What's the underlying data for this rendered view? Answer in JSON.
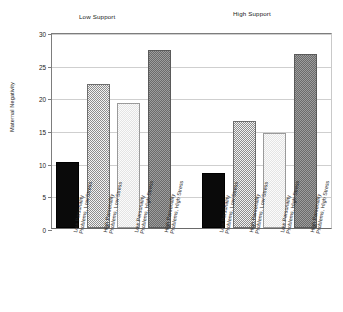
{
  "chart_data": {
    "type": "bar",
    "title": "",
    "xlabel": "",
    "ylabel": "Maternal Negativity",
    "ylim": [
      0,
      30
    ],
    "yticks": [
      0,
      5,
      10,
      15,
      20,
      25,
      30
    ],
    "grid": true,
    "legend": "none",
    "panels": [
      {
        "name": "Low Support",
        "categories": [
          "Low Personality Problems, Low Stress",
          "High Personality Problems, Low Stress",
          "Low Personality Problems, High Stress",
          "High Personality Problems, High Stress"
        ],
        "values": [
          10.1,
          22.1,
          19.2,
          27.2
        ]
      },
      {
        "name": "High Support",
        "categories": [
          "Low Personality Problems, Low Stress",
          "High Personality Problems, Low Stress",
          "Low Personality Problems, High Stress",
          "High Personality Problems, High Stress"
        ],
        "values": [
          8.4,
          16.4,
          14.5,
          26.6
        ]
      }
    ],
    "bar_styles": [
      "solid-black",
      "checker-mid",
      "checker-light",
      "checker-dark"
    ],
    "colors": {
      "solid_black": "#0a0a0a",
      "checker_mid": "#8d8d8d",
      "checker_light": "#e4e4e4",
      "checker_dark": "#6b6b6b",
      "axis": "#7d7d7d",
      "grid": "#cfcfcf",
      "text": "#222222",
      "background": "#ffffff"
    }
  },
  "ticklabels": {
    "y": [
      "30",
      "25",
      "20",
      "15",
      "10",
      "5",
      "0"
    ]
  },
  "xtick_lines": [
    [
      "Low Personality",
      "Problems, Low Stress"
    ],
    [
      "High Personality",
      "Problems, Low Stress"
    ],
    [
      "Low Personality",
      "Problems, High Stress"
    ],
    [
      "High Personality",
      "Problems, High Stress"
    ],
    [
      "Low Personality",
      "Problems, Low Stress"
    ],
    [
      "High Personality",
      "Problems, Low Stress"
    ],
    [
      "Low Personality",
      "Problems, High Stress"
    ],
    [
      "High Personality",
      "Problems, High Stress"
    ]
  ]
}
